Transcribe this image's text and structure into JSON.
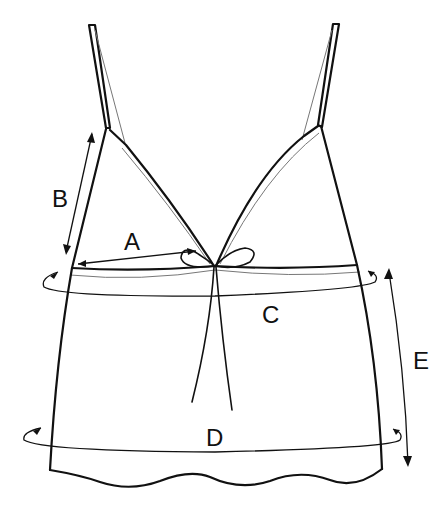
{
  "diagram": {
    "type": "garment measurement diagram",
    "labels": {
      "A": "A",
      "B": "B",
      "C": "C",
      "D": "D",
      "E": "E"
    },
    "measurements": [
      {
        "id": "A",
        "description": "half bust width arrow from side seam to center bow"
      },
      {
        "id": "B",
        "description": "vertical arrow along side from armhole to underbust"
      },
      {
        "id": "C",
        "description": "circumference loop around underbust band"
      },
      {
        "id": "D",
        "description": "circumference loop around hem"
      },
      {
        "id": "E",
        "description": "vertical arrow from underbust to hem (length)"
      }
    ],
    "colors": {
      "line": "#111111",
      "secondary_line": "#777777",
      "background": "#ffffff"
    }
  }
}
